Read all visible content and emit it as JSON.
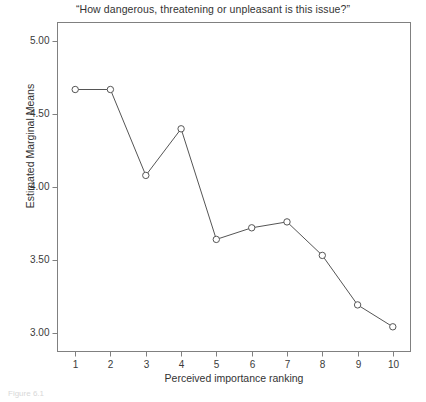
{
  "chart_data": {
    "type": "line",
    "title": "“How dangerous, threatening or unpleasant is this issue?”",
    "xlabel": "Perceived importance ranking",
    "ylabel": "Estimated Marginal Means",
    "categories": [
      "1",
      "2",
      "3",
      "4",
      "5",
      "6",
      "7",
      "8",
      "9",
      "10"
    ],
    "x": [
      1,
      2,
      3,
      4,
      5,
      6,
      7,
      8,
      9,
      10
    ],
    "values": [
      4.67,
      4.67,
      4.08,
      4.4,
      3.64,
      3.72,
      3.76,
      3.53,
      3.19,
      3.04
    ],
    "series": [
      {
        "name": "Estimated Marginal Means",
        "values": [
          4.67,
          4.67,
          4.08,
          4.4,
          3.64,
          3.72,
          3.76,
          3.53,
          3.19,
          3.04
        ]
      }
    ],
    "xlim": [
      0.5,
      10.5
    ],
    "ylim": [
      2.87,
      5.13
    ],
    "ytick_labels": [
      "5.00",
      "4.50",
      "4.00",
      "3.50",
      "3.00"
    ],
    "ytick_values": [
      5.0,
      4.5,
      4.0,
      3.5,
      3.0
    ],
    "xtick_labels": [
      "1",
      "2",
      "3",
      "4",
      "5",
      "6",
      "7",
      "8",
      "9",
      "10"
    ],
    "grid": false,
    "legend": "none",
    "marker": "open-circle",
    "line_color": "#555555",
    "marker_fill": "#ffffff",
    "marker_stroke": "#555555",
    "frame_color": "#808080",
    "background": "#ffffff"
  },
  "caption": {
    "text": "Figure 6.1"
  }
}
